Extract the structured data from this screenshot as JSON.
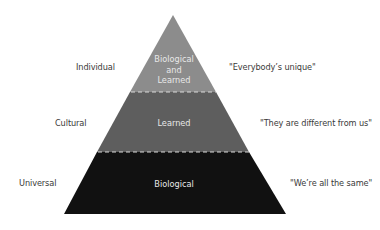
{
  "diagram": {
    "type": "pyramid",
    "tiers": [
      {
        "level": "Individual",
        "inner_lines": [
          "Biological",
          "and",
          "Learned"
        ],
        "quote": "\"Everybody’s unique\"",
        "color": "#8c8c8c"
      },
      {
        "level": "Cultural",
        "inner_lines": [
          "Learned"
        ],
        "quote": "\"They are different from us\"",
        "color": "#5e5e5e"
      },
      {
        "level": "Universal",
        "inner_lines": [
          "Biological"
        ],
        "quote": "\"We’re all the same\"",
        "color": "#111111"
      }
    ],
    "divider_color": "#d9d9d9"
  }
}
